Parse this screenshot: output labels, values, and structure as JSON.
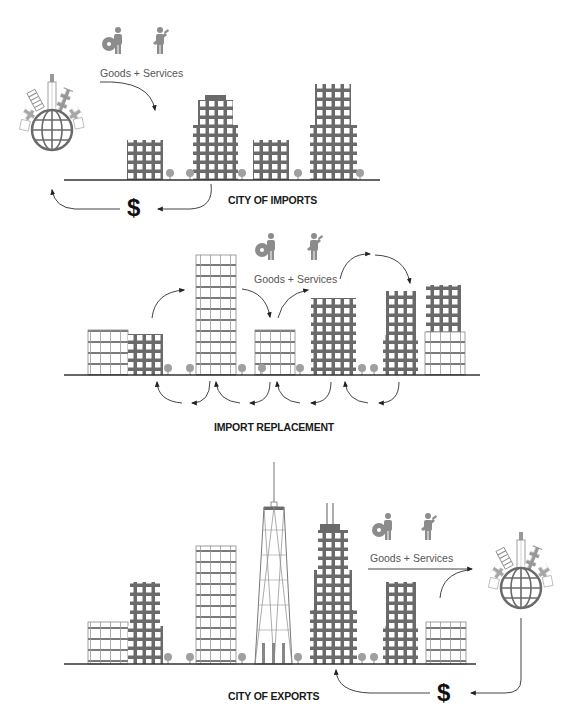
{
  "colors": {
    "building_dark": "#6a6a6a",
    "building_light": "#8a8a8a",
    "ground": "#333333",
    "arrow": "#444444",
    "icon": "#8c8c8c",
    "tree": "#9a9a9a",
    "text": "#1a1a1a"
  },
  "panels": [
    {
      "id": "city-of-imports",
      "title": "CITY OF IMPORTS",
      "flow_label": "Goods + Services",
      "currency_symbol": "$",
      "icons": [
        "gear-person-icon",
        "worker-tools-icon"
      ],
      "globe": "globe-skyline-icon"
    },
    {
      "id": "import-replacement",
      "title": "IMPORT REPLACEMENT",
      "flow_label": "Goods + Services",
      "icons": [
        "gear-person-icon",
        "worker-tools-icon"
      ]
    },
    {
      "id": "city-of-exports",
      "title": "CITY OF EXPORTS",
      "flow_label": "Goods + Services",
      "currency_symbol": "$",
      "icons": [
        "gear-person-icon",
        "worker-tools-icon"
      ],
      "globe": "globe-skyline-icon"
    }
  ]
}
